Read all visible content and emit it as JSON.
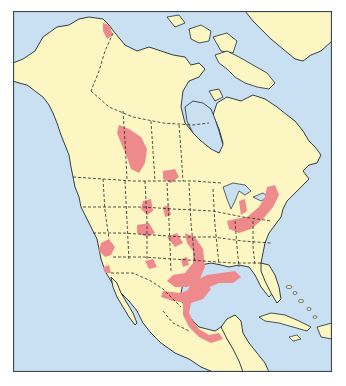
{
  "map": {
    "title": "",
    "subject": "North America range map",
    "legend": [],
    "colors": {
      "ocean": "#c9dff2",
      "land": "#fbf6c2",
      "range": "#ee8a8c",
      "coastline": "#1e2a36",
      "border": "#2a2a2a",
      "frame": "#3b4654",
      "background": "#ffffff"
    },
    "regions_shown": [
      "Alaska",
      "Canada",
      "Greenland",
      "Contiguous United States",
      "Mexico",
      "Central America",
      "Caribbean (Cuba, Bahamas, Hispaniola)",
      "Hudson Bay",
      "Gulf of Mexico"
    ],
    "highlighted_ranges": [
      {
        "name": "northern Alaska/Yukon coast"
      },
      {
        "name": "Alberta / Saskatchewan prairie"
      },
      {
        "name": "Montana–North Dakota border"
      },
      {
        "name": "Wyoming / Colorado scattered patches"
      },
      {
        "name": "Utah / Nevada patches"
      },
      {
        "name": "California coast"
      },
      {
        "name": "Arizona / New Mexico"
      },
      {
        "name": "Kansas–Oklahoma–Texas arc"
      },
      {
        "name": "Ohio Valley / Great Lakes arc"
      },
      {
        "name": "Louisiana / Texas Gulf coast"
      },
      {
        "name": "Mexico Gulf coast to Yucatán base"
      }
    ]
  }
}
